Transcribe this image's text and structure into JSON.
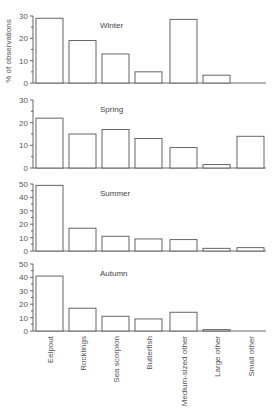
{
  "chart_data": {
    "type": "bar",
    "ylabel": "% of observations",
    "xlabel": "",
    "categories": [
      "Eelpout",
      "Rocklings",
      "Sea scorpion",
      "Butterfish",
      "Medium-sized other",
      "Large other",
      "Small other"
    ],
    "panels": [
      {
        "title": "Winter",
        "ylim": [
          0,
          30
        ],
        "yticks": [
          0,
          10,
          20,
          30
        ],
        "values": [
          29,
          19,
          13,
          5,
          28.5,
          3.5,
          0
        ]
      },
      {
        "title": "Spring",
        "ylim": [
          0,
          30
        ],
        "yticks": [
          0,
          10,
          20,
          30
        ],
        "values": [
          22,
          15,
          17,
          13,
          9,
          1.5,
          14
        ]
      },
      {
        "title": "Summer",
        "ylim": [
          0,
          50
        ],
        "yticks": [
          0,
          10,
          20,
          30,
          40,
          50
        ],
        "values": [
          49,
          17,
          11,
          9,
          8.5,
          2,
          2.5
        ]
      },
      {
        "title": "Autumn",
        "ylim": [
          0,
          50
        ],
        "yticks": [
          0,
          10,
          20,
          30,
          40,
          50
        ],
        "values": [
          41,
          17,
          11,
          9,
          14,
          1,
          0
        ]
      }
    ],
    "grid": false,
    "legend": null
  }
}
